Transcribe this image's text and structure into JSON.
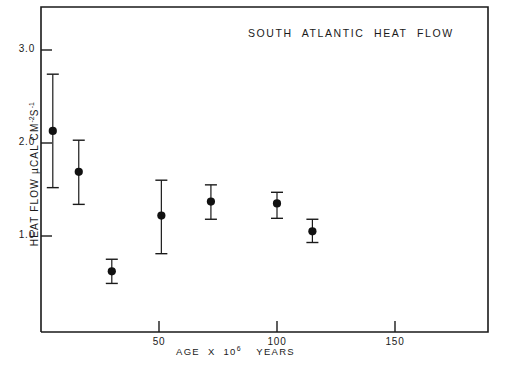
{
  "figure": {
    "title": "SOUTH  ATLANTIC  HEAT  FLOW",
    "background": "#ffffff",
    "ink_color": "#1a1a1a"
  },
  "axes": {
    "ylabel_prefix": "HEAT  FLOW  µCAL CM",
    "ylabel_exp1": "-2",
    "ylabel_mid": "S",
    "ylabel_exp2": "-1",
    "xlabel_prefix": "AGE  X  10",
    "xlabel_exp": "6",
    "xlabel_suffix": "YEARS",
    "ytick_labels": [
      "3.0",
      "2.0",
      "1.0"
    ],
    "xtick_labels": [
      "50",
      "100",
      "150"
    ]
  },
  "chart_data": {
    "type": "scatter",
    "title": "SOUTH ATLANTIC HEAT FLOW",
    "xlabel": "AGE X 10^6 YEARS",
    "ylabel": "HEAT FLOW µCAL CM^-2 S^-1",
    "xlim": [
      0,
      190
    ],
    "ylim": [
      0.0,
      3.5
    ],
    "xticks": [
      50,
      100,
      150
    ],
    "yticks": [
      3.0,
      2.0,
      1.0
    ],
    "grid": false,
    "legend": null,
    "error_bars": "vertical",
    "marker": "filled-circle",
    "points": [
      {
        "x": 5,
        "y": 2.13,
        "yerr_low": 1.52,
        "yerr_high": 2.74
      },
      {
        "x": 16,
        "y": 1.69,
        "yerr_low": 1.34,
        "yerr_high": 2.03
      },
      {
        "x": 30,
        "y": 0.62,
        "yerr_low": 0.49,
        "yerr_high": 0.75
      },
      {
        "x": 51,
        "y": 1.22,
        "yerr_low": 0.81,
        "yerr_high": 1.6
      },
      {
        "x": 72,
        "y": 1.37,
        "yerr_low": 1.18,
        "yerr_high": 1.55
      },
      {
        "x": 100,
        "y": 1.35,
        "yerr_low": 1.19,
        "yerr_high": 1.47
      },
      {
        "x": 115,
        "y": 1.05,
        "yerr_low": 0.93,
        "yerr_high": 1.18
      }
    ]
  }
}
